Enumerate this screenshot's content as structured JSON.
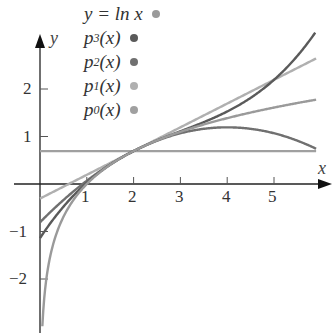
{
  "chart_data": {
    "type": "line",
    "title": "",
    "xlabel": "x",
    "ylabel": "y",
    "xlim": [
      0,
      6
    ],
    "ylim": [
      -3,
      3
    ],
    "x_ticks": [
      "1",
      "2",
      "3",
      "4",
      "5"
    ],
    "y_ticks": [
      "-2",
      "-1",
      "1",
      "2"
    ],
    "grid": false,
    "legend_position": "top",
    "series": [
      {
        "name": "y = ln x",
        "color": "#9a9a9a",
        "formula": "ln(x)",
        "domain": [
          0.05,
          5.9
        ]
      },
      {
        "name": "p3(x)",
        "color": "#5a5a5a",
        "formula": "ln2 + (x-2)/2 - (x-2)^2/8 + (x-2)^3/24",
        "domain": [
          0,
          5.9
        ]
      },
      {
        "name": "p2(x)",
        "color": "#707070",
        "formula": "ln2 + (x-2)/2 - (x-2)^2/8",
        "domain": [
          0,
          5.9
        ]
      },
      {
        "name": "p1(x)",
        "color": "#b0b0b0",
        "formula": "ln2 + (x-2)/2",
        "domain": [
          0,
          5.9
        ]
      },
      {
        "name": "p0(x)",
        "color": "#a0a0a0",
        "formula": "ln2",
        "domain": [
          0,
          5.9
        ]
      }
    ]
  },
  "legend": [
    {
      "label": "y = ln x",
      "color": "#9a9a9a"
    },
    {
      "label_main": "p",
      "sub": "3",
      "tail": "(x)",
      "color": "#5a5a5a"
    },
    {
      "label_main": "p",
      "sub": "2",
      "tail": "(x)",
      "color": "#707070"
    },
    {
      "label_main": "p",
      "sub": "1",
      "tail": "(x)",
      "color": "#b0b0b0"
    },
    {
      "label_main": "p",
      "sub": "0",
      "tail": "(x)",
      "color": "#a0a0a0"
    }
  ],
  "axes": {
    "x_name": "x",
    "y_name": "y"
  },
  "ticks": {
    "x": [
      "1",
      "2",
      "3",
      "4",
      "5"
    ],
    "y": [
      "2",
      "1",
      "−1",
      "−2"
    ]
  }
}
